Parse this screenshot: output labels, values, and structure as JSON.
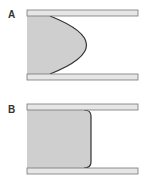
{
  "figure": {
    "panels": [
      {
        "label": "A",
        "profile": "parabolic",
        "description": "Laminar flow velocity profile between parallel plates"
      },
      {
        "label": "B",
        "profile": "plug",
        "description": "Plug flow velocity profile between parallel plates"
      }
    ]
  },
  "colors": {
    "plate_fill": "#e6e6e6",
    "plate_stroke": "#777777",
    "fluid_fill": "#cfcfcf",
    "profile_stroke": "#333333",
    "label": "#333333"
  }
}
